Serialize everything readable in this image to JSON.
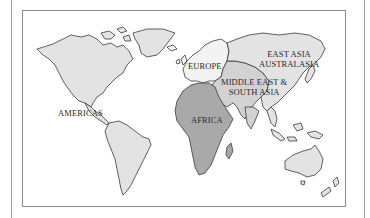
{
  "map": {
    "title": "World regions map",
    "colors": {
      "americas": "#e3e3e3",
      "europe": "#f3f3f3",
      "middle_east_south_asia": "#d2d2d2",
      "east_asia_australasia": "#e3e3e3",
      "africa": "#a9a9a9",
      "outline": "#3a3a3a",
      "ocean": "#ffffff",
      "frame": "#8a8a8a"
    },
    "regions": [
      {
        "id": "americas",
        "label": "Americas"
      },
      {
        "id": "europe",
        "label": "Europe"
      },
      {
        "id": "africa",
        "label": "Africa"
      },
      {
        "id": "middle_east_south_asia",
        "label_line1": "Middle East &",
        "label_line2": "South Asia"
      },
      {
        "id": "east_asia_australasia",
        "label_line1": "East Asia",
        "label_line2": "Australasia"
      }
    ]
  }
}
